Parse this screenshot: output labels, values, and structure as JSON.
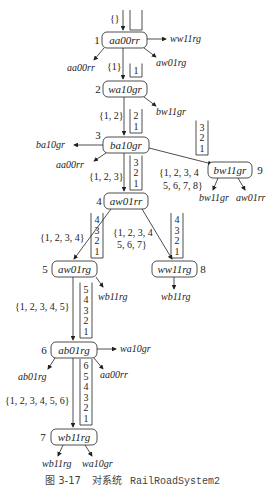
{
  "figure": {
    "caption_prefix": "图 3-17",
    "caption_text": "对系统",
    "caption_code": "RailRoadSystem2"
  },
  "nodes": [
    {
      "id": 1,
      "label": "aa00rr",
      "number": "1"
    },
    {
      "id": 2,
      "label": "wa10gr",
      "number": "2"
    },
    {
      "id": 3,
      "label": "ba10gr",
      "number": "3"
    },
    {
      "id": 4,
      "label": "aw01rr",
      "number": "4"
    },
    {
      "id": 5,
      "label": "aw01rg",
      "number": "5"
    },
    {
      "id": 6,
      "label": "ab01rg",
      "number": "6"
    },
    {
      "id": 7,
      "label": "wb11rg",
      "number": "7"
    },
    {
      "id": 8,
      "label": "ww11rg",
      "number": "8"
    },
    {
      "id": 9,
      "label": "bw11gr",
      "number": "9"
    }
  ],
  "leaves": {
    "n1_right": "ww11rg",
    "n1_left": "aa00rr",
    "n1_down_right": "aw01rg",
    "n2_right": "bw11gr",
    "n3_left": "ba10gr",
    "n3_down_left": "aa00rr",
    "n9_left": "bw11gr",
    "n9_right": "aw01rr",
    "n5_right": "wb11rg",
    "n8_down": "wb11rg",
    "n6_right": "wa10gr",
    "n6_left": "ab01rg",
    "n6_down_right": "aa00rr",
    "n7_left": "wb11rg",
    "n7_right": "wa10gr"
  },
  "edge_labels": {
    "start": "{}",
    "e12": "{1}",
    "e23": "{1, 2}",
    "e34": "{1, 2, 3}",
    "e39_line1": "{1, 2, 3, 4",
    "e39_line2": "5, 6, 7, 8}",
    "e45": "{1, 2, 3, 4}",
    "e48_line1": "{1, 2, 3, 4",
    "e48_line2": "5, 6, 7}",
    "e56": "{1, 2, 3, 4, 5}",
    "e67": "{1, 2, 3, 4, 5, 6}"
  },
  "stacks": {
    "start": [],
    "e12": [
      "1"
    ],
    "e23": [
      "2",
      "1"
    ],
    "e34": [
      "3",
      "2",
      "1"
    ],
    "e39": [
      "3",
      "2",
      "1"
    ],
    "e45": [
      "4",
      "3",
      "2",
      "1"
    ],
    "e48": [
      "4",
      "3",
      "2",
      "1"
    ],
    "e56": [
      "5",
      "4",
      "3",
      "2",
      "1"
    ],
    "e67": [
      "6",
      "5",
      "4",
      "3",
      "2",
      "1"
    ]
  }
}
